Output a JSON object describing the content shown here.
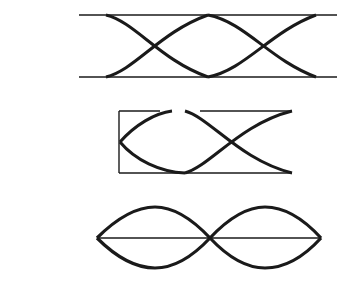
{
  "diagram": {
    "background": "#ffffff",
    "stroke_color": "#1a1a1a",
    "figures": [
      {
        "id": "figure-top",
        "description": "two-crossing eye pattern between two horizontal rails",
        "rail_top_y": 15,
        "rail_bottom_y": 77,
        "rail_x_start": 79,
        "rail_x_end": 337,
        "touch_points_x": [
          106,
          208,
          316
        ],
        "crossings_x": [
          150,
          264
        ]
      },
      {
        "id": "figure-middle",
        "description": "boxed eye pattern with open left bracket and one crossing",
        "box_left_x": 119,
        "box_right_x": 292,
        "box_top_y": 111,
        "box_bottom_y": 173,
        "left_tip_y": 142,
        "crossing_x": 232
      },
      {
        "id": "figure-bottom",
        "description": "double lens shape bisected by a horizontal axis",
        "left_tip_x": 97,
        "right_tip_x": 321,
        "center_y": 238,
        "top_y": 207,
        "bottom_y": 268,
        "crossing_x": 210
      }
    ]
  }
}
